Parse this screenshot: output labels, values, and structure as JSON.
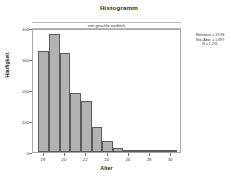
{
  "chart_data": {
    "type": "bar",
    "title": "Histogramm",
    "subtitle": "von geschl= weiblich",
    "xlabel": "Alter",
    "ylabel": "Häufigkeit",
    "xlim": [
      17,
      31
    ],
    "ylim": [
      0,
      400
    ],
    "grid": false,
    "legend_position": "right-annotation",
    "bin_width": 1,
    "categories": [
      "18",
      "19",
      "20",
      "21",
      "22",
      "23",
      "24",
      "25",
      "26",
      "27",
      "28",
      "29",
      "30"
    ],
    "x_tick_labels": [
      "18",
      "20",
      "22",
      "24",
      "26",
      "28",
      "30"
    ],
    "x_tick_values": [
      18,
      20,
      22,
      24,
      26,
      28,
      30
    ],
    "y_tick_labels": [
      "0",
      "100",
      "200",
      "300",
      "400"
    ],
    "y_tick_values": [
      0,
      100,
      200,
      300,
      400
    ],
    "values": [
      325,
      382,
      318,
      190,
      163,
      80,
      35,
      14,
      3,
      1,
      0,
      0,
      2
    ],
    "series": [
      {
        "name": "Häufigkeit",
        "values": [
          325,
          382,
          318,
          190,
          163,
          80,
          35,
          14,
          3,
          1,
          0,
          0,
          2
        ]
      }
    ],
    "bar_fill_color": "#b2b2b2",
    "bar_edge_color": "#5a5a5a",
    "frame_color": "#a8a8a8",
    "annotations": {
      "mean_label": "Mittelwert = 19,98",
      "std_label": "Std.-Abw. = 1,897",
      "n_label": "N = 1.291"
    }
  },
  "stats": {
    "mean": "Mittelwert = 19,98",
    "std": "Std.-Abw. = 1,897",
    "n": "N = 1.291"
  }
}
